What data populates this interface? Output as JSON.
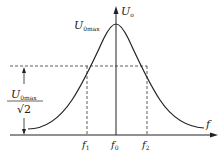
{
  "diagram": {
    "type": "frequency-response-curve",
    "y_axis_label": "U",
    "y_axis_sub": "o",
    "x_axis_label": "f",
    "peak_label": "U",
    "peak_sub": "0max",
    "fraction": {
      "numerator": "U",
      "numerator_sub": "0max",
      "denominator": "√2"
    },
    "ticks": [
      {
        "label": "f",
        "sub": "1"
      },
      {
        "label": "f",
        "sub": "0"
      },
      {
        "label": "f",
        "sub": "2"
      }
    ],
    "colors": {
      "line": "#222222",
      "dashed": "#333333"
    }
  }
}
